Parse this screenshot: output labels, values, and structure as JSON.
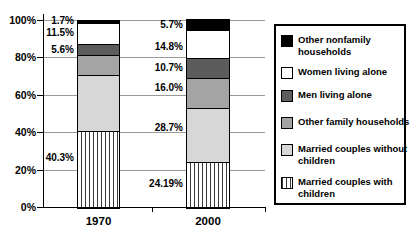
{
  "chart_data": {
    "type": "bar",
    "subtype": "stacked-column",
    "title": "",
    "xlabel": "",
    "ylabel": "",
    "categories": [
      "1970",
      "2000"
    ],
    "y_axis": {
      "min": 0,
      "max": 100,
      "tick_labels": [
        "0%",
        "20%",
        "40%",
        "60%",
        "80%",
        "100%"
      ],
      "tick_step": 20,
      "grid": true
    },
    "series": [
      {
        "name": "Married couples with children",
        "swatch": "stripes",
        "values": [
          40.3,
          24.19
        ],
        "data_labels": [
          "40.3%",
          "24.19%"
        ],
        "label_y_pct": [
          26.1,
          null
        ]
      },
      {
        "name": "Married couples without children",
        "swatch": "light_gray",
        "values": [
          30.3,
          28.7
        ],
        "data_labels": [
          "",
          "28.7%"
        ],
        "label_y_pct": [
          null,
          42.1
        ]
      },
      {
        "name": "Other family households",
        "swatch": "medium_gray",
        "values": [
          10.6,
          16.0
        ],
        "data_labels": [
          "",
          "16.0%"
        ],
        "label_y_pct": [
          null,
          63.5
        ]
      },
      {
        "name": "Men living alone",
        "swatch": "dark_gray",
        "values": [
          5.6,
          10.7
        ],
        "data_labels": [
          "5.6%",
          "10.7%"
        ],
        "label_y_pct": [
          null,
          null
        ]
      },
      {
        "name": "Women living alone",
        "swatch": "white",
        "values": [
          11.5,
          14.8
        ],
        "data_labels": [
          "11.5%",
          "14.8%"
        ],
        "label_y_pct": [
          null,
          85.3
        ]
      },
      {
        "name": "Other nonfamily households",
        "swatch": "black",
        "values": [
          1.7,
          5.7
        ],
        "data_labels": [
          "1.7%",
          "5.7%"
        ],
        "label_y_pct": [
          null,
          null
        ]
      }
    ],
    "legend": {
      "position": "right",
      "entries": [
        {
          "swatch": "black",
          "lines": [
            "Other nonfamily",
            "households"
          ]
        },
        {
          "swatch": "white",
          "lines": [
            "Women living alone"
          ]
        },
        {
          "swatch": "dark_gray",
          "lines": [
            "Men living alone"
          ]
        },
        {
          "swatch": "medium_gray",
          "lines": [
            "Other family households"
          ]
        },
        {
          "swatch": "light_gray",
          "lines": [
            "Married couples without",
            "children"
          ]
        },
        {
          "swatch": "stripes",
          "lines": [
            "Married couples with",
            "children"
          ]
        }
      ]
    },
    "colors": {
      "black": "#000000",
      "white": "#ffffff",
      "dark_gray": "#5c5c5c",
      "medium_gray": "#a4a4a4",
      "light_gray": "#d7d7d7",
      "stripe_line": "#3a3a3a",
      "gridline": "#999999",
      "axis": "#000000"
    }
  }
}
